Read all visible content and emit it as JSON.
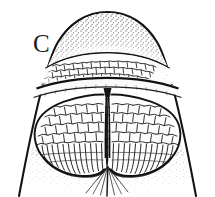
{
  "figure": {
    "panel_label": "C",
    "caption": "",
    "background_color": "#ffffff",
    "ink_color": "#111111",
    "view": "ventral view of snout / head tip",
    "width_px": 215,
    "height_px": 197
  },
  "regions": [
    {
      "id": "snout-tip",
      "name": "rostral-tip",
      "texture": "stipple",
      "shading": "dense stipple fading toward center"
    },
    {
      "id": "upper-plate",
      "name": "upper-scaled-plate",
      "texture": "polygonal-scales",
      "scale_count_approx": 150
    },
    {
      "id": "transverse-band",
      "name": "transverse-lip-band",
      "texture": "smooth-band",
      "shading": "dark outline above, pale fill"
    },
    {
      "id": "left-lobe",
      "name": "left-mandibular-lobe",
      "texture": "polygonal-scales-with-radiating-margin"
    },
    {
      "id": "right-lobe",
      "name": "right-mandibular-lobe",
      "texture": "polygonal-scales-with-radiating-margin"
    },
    {
      "id": "median-groove",
      "name": "median-sulcus",
      "texture": "dark-groove"
    },
    {
      "id": "chin",
      "name": "gular-chin-area",
      "texture": "stipple-with-radiating-lines"
    }
  ],
  "colors": {
    "ink": "#111111",
    "mid_ink": "#3a3a3a",
    "light_ink": "#6e6e6e",
    "paper": "#ffffff",
    "fill_pale": "#fbfbfb"
  }
}
